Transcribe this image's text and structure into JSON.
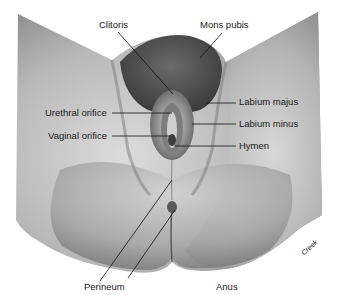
{
  "figure": {
    "signature": "Creek",
    "colors": {
      "skin_light": "#d8d8d8",
      "skin_mid": "#a9a9a9",
      "skin_dark": "#6e6e6e",
      "hair": "#4a4a4a",
      "line": "#111111",
      "text": "#1a1a1a"
    }
  },
  "labels": {
    "clitoris": "Clitoris",
    "mons_pubis": "Mons pubis",
    "labium_majus": "Labium majus",
    "labium_minus": "Labium minus",
    "hymen": "Hymen",
    "urethral_orifice": "Urethral orifice",
    "vaginal_orifice": "Vaginal orifice",
    "perineum": "Perineum",
    "anus": "Anus"
  }
}
